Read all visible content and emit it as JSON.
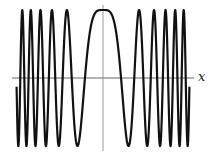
{
  "chart_data": {
    "type": "line",
    "title": "",
    "function": "cos(x^2)",
    "xlabel": "x",
    "ylabel": "",
    "xlim": [
      -6.0,
      6.0
    ],
    "ylim": [
      -1,
      1
    ],
    "grid": false,
    "legend": null,
    "series": [
      {
        "name": "cos(x^2)",
        "color": "#111111",
        "sample_points": {
          "x": [
            -6.0,
            -5.884,
            -5.605,
            -5.317,
            -5.013,
            -4.69,
            -4.342,
            -3.963,
            -3.545,
            -3.07,
            -2.507,
            -1.772,
            -1.253,
            0,
            1.253,
            1.772,
            2.507,
            3.07,
            3.545,
            3.963,
            4.342,
            4.69,
            5.013,
            5.317,
            5.605,
            5.884,
            6.0
          ],
          "y": [
            -0.128,
            -1,
            1,
            -1,
            1,
            -1,
            1,
            -1,
            1,
            -1,
            1,
            -1,
            0,
            1,
            0,
            -1,
            1,
            -1,
            1,
            -1,
            1,
            -1,
            1,
            -1,
            1,
            -1,
            -0.128
          ]
        }
      }
    ],
    "axes": {
      "x_axis_color": "#555555",
      "y_axis_color": "#888888"
    }
  },
  "labels": {
    "x_axis": "x"
  }
}
